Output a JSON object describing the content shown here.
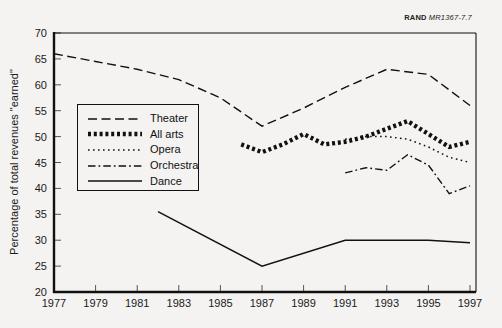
{
  "header": {
    "brand": "RAND",
    "doc_id": "MR1367-7.7"
  },
  "chart_data": {
    "type": "line",
    "title": "",
    "xlabel": "",
    "ylabel": "Percentage of total revenues \"earned\"",
    "ylim": [
      20,
      70
    ],
    "xlim": [
      1977,
      1997.3
    ],
    "y_ticks": [
      20,
      25,
      30,
      35,
      40,
      45,
      50,
      55,
      60,
      65,
      70
    ],
    "x_ticks": [
      1977,
      1979,
      1981,
      1983,
      1985,
      1987,
      1989,
      1991,
      1993,
      1995,
      1997
    ],
    "grid": false,
    "legend_position": "upper-left-inside",
    "series": [
      {
        "name": "Theater",
        "style": "long-dash",
        "years": [
          1977,
          1979,
          1981,
          1983,
          1985,
          1987,
          1989,
          1991,
          1993,
          1995,
          1997
        ],
        "values": [
          66,
          64.5,
          63,
          61,
          57.5,
          52,
          55.5,
          59.5,
          63,
          62,
          56
        ]
      },
      {
        "name": "All arts",
        "style": "bold-dot",
        "years": [
          1986,
          1987,
          1988,
          1989,
          1990,
          1991,
          1992,
          1993,
          1994,
          1995,
          1996,
          1997
        ],
        "values": [
          48.5,
          47,
          48.5,
          50.5,
          48.5,
          49,
          50,
          51.5,
          53,
          50.5,
          48,
          49
        ]
      },
      {
        "name": "Opera",
        "style": "fine-dot",
        "years": [
          1991,
          1992,
          1993,
          1994,
          1995,
          1996,
          1997
        ],
        "values": [
          49.5,
          50,
          50,
          49.5,
          48,
          46,
          45
        ]
      },
      {
        "name": "Orchestra",
        "style": "dash-dot",
        "years": [
          1991,
          1992,
          1993,
          1994,
          1995,
          1996,
          1997
        ],
        "values": [
          43,
          44,
          43.5,
          46.5,
          44.5,
          39,
          40.5
        ]
      },
      {
        "name": "Dance",
        "style": "solid",
        "years": [
          1982,
          1987,
          1991,
          1993,
          1995,
          1997
        ],
        "values": [
          35.5,
          25,
          30,
          30,
          30,
          29.5
        ]
      }
    ]
  }
}
